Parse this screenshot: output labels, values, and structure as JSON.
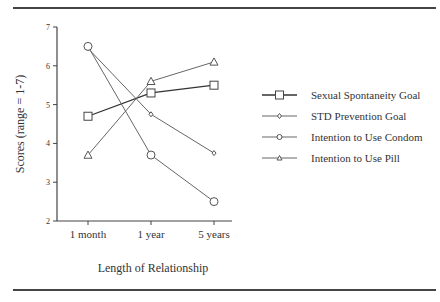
{
  "chart_data": {
    "type": "line",
    "title": "",
    "xlabel": "Length of Relationship",
    "ylabel": "Scores (range = 1-7)",
    "categories": [
      "1 month",
      "1 year",
      "5 years"
    ],
    "ylim": [
      2,
      7
    ],
    "yticks": [
      2,
      3,
      4,
      5,
      6,
      7
    ],
    "grid": false,
    "legend_position": "right",
    "series": [
      {
        "name": "Sexual Spontaneity Goal",
        "marker": "square",
        "values": [
          4.7,
          5.3,
          5.5
        ]
      },
      {
        "name": "STD Prevention Goal",
        "marker": "diamond",
        "values": [
          6.45,
          4.75,
          3.75
        ]
      },
      {
        "name": "Intention to Use Condom",
        "marker": "circle",
        "values": [
          6.5,
          3.7,
          2.5
        ]
      },
      {
        "name": "Intention to Use Pill",
        "marker": "triangle",
        "values": [
          3.7,
          5.6,
          6.1
        ]
      }
    ]
  }
}
